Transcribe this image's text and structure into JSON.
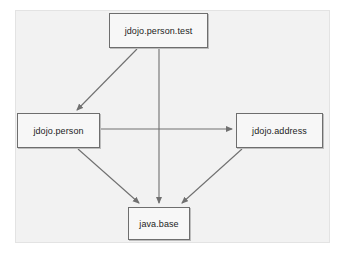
{
  "diagram": {
    "type": "module-dependency-graph",
    "background_color": "#f2f2f2",
    "node_fill_color": "#f7f7f7",
    "node_border_color": "#6e6e6e",
    "edge_color": "#707070",
    "nodes": [
      {
        "id": "jdojo.person.test",
        "label": "jdojo.person.test",
        "x": 109,
        "y": 13,
        "width": 99,
        "height": 35
      },
      {
        "id": "jdojo.person",
        "label": "jdojo.person",
        "x": 17,
        "y": 113,
        "width": 83,
        "height": 35
      },
      {
        "id": "jdojo.address",
        "label": "jdojo.address",
        "x": 236,
        "y": 113,
        "width": 87,
        "height": 35
      },
      {
        "id": "java.base",
        "label": "java.base",
        "x": 128,
        "y": 207,
        "width": 62,
        "height": 33
      }
    ],
    "edges": [
      {
        "id": "edge-test-to-person",
        "from": "jdojo.person.test",
        "to": "jdojo.person",
        "arrowhead": true
      },
      {
        "id": "edge-test-to-java-base",
        "from": "jdojo.person.test",
        "to": "java.base",
        "arrowhead": true
      },
      {
        "id": "edge-person-to-address",
        "from": "jdojo.person",
        "to": "jdojo.address",
        "arrowhead": true
      },
      {
        "id": "edge-person-to-java-base",
        "from": "jdojo.person",
        "to": "java.base",
        "arrowhead": true
      },
      {
        "id": "edge-address-to-java-base",
        "from": "jdojo.address",
        "to": "java.base",
        "arrowhead": true
      }
    ]
  }
}
